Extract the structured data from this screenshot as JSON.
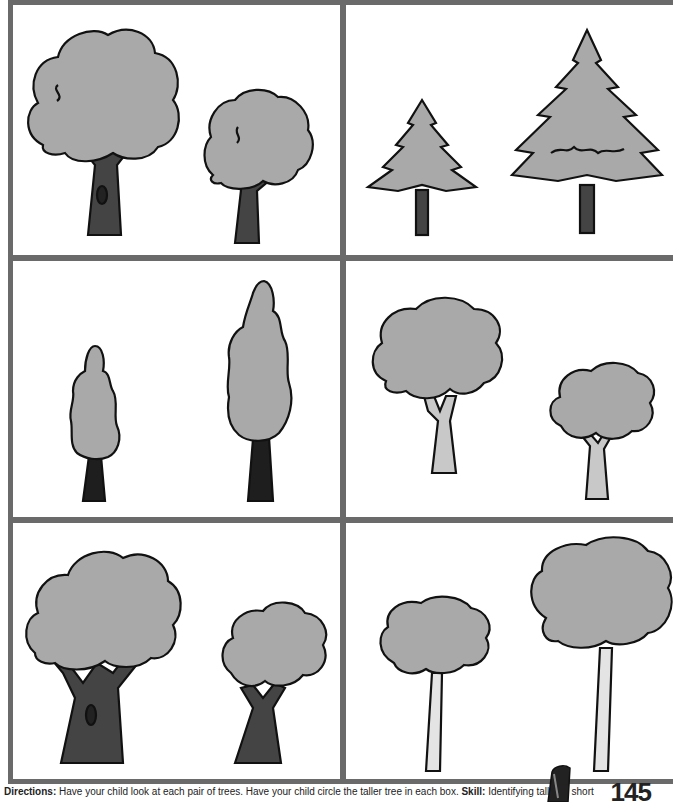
{
  "page": {
    "number": "145",
    "directions_label": "Directions:",
    "directions_text": "Have your child look at each pair of trees. Have your child circle the taller tree in each box.",
    "skill_label": "Skill:",
    "skill_text": "Identifying tall and short"
  },
  "colors": {
    "border": "#6a6a6a",
    "foliage": "#a9a9a9",
    "trunk_dark": "#444444",
    "trunk_light": "#c8c8c8",
    "trunk_birch": "#e4e4e4",
    "outline": "#111111"
  },
  "panels": [
    {
      "id": 1,
      "kind": "leafy-oak",
      "trees": [
        {
          "size": "tall",
          "trunk": "dark"
        },
        {
          "size": "short",
          "trunk": "dark"
        }
      ]
    },
    {
      "id": 2,
      "kind": "pine",
      "trees": [
        {
          "size": "short",
          "trunk": "dark"
        },
        {
          "size": "tall",
          "trunk": "dark"
        }
      ]
    },
    {
      "id": 3,
      "kind": "cypress",
      "trees": [
        {
          "size": "short",
          "trunk": "dark"
        },
        {
          "size": "tall",
          "trunk": "dark"
        }
      ]
    },
    {
      "id": 4,
      "kind": "broadleaf",
      "trees": [
        {
          "size": "tall",
          "trunk": "light"
        },
        {
          "size": "short",
          "trunk": "light"
        }
      ]
    },
    {
      "id": 5,
      "kind": "gnarled-oak",
      "trees": [
        {
          "size": "tall",
          "trunk": "dark"
        },
        {
          "size": "short",
          "trunk": "dark"
        }
      ]
    },
    {
      "id": 6,
      "kind": "birch",
      "trees": [
        {
          "size": "short",
          "trunk": "birch"
        },
        {
          "size": "tall",
          "trunk": "birch"
        }
      ]
    }
  ]
}
